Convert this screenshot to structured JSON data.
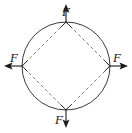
{
  "figure": {
    "name": "biaxial-tension-circle-diagram",
    "background_color": "#ffffff",
    "stroke_color": "#3a3a3a",
    "dashed_stroke_color": "#6e6e6e",
    "arrow_color": "#1a1a1a",
    "circle": {
      "center_x": 66,
      "center_y": 66,
      "radius": 44
    },
    "diamond": {
      "style": "dashed",
      "vertices": [
        {
          "name": "top",
          "x": 66,
          "y": 22
        },
        {
          "name": "right",
          "x": 110,
          "y": 66
        },
        {
          "name": "bottom",
          "x": 66,
          "y": 110
        },
        {
          "name": "left",
          "x": 22,
          "y": 66
        }
      ]
    },
    "forces": [
      {
        "name": "force-top",
        "label": "F",
        "direction": "up",
        "label_x": 66,
        "label_y": 16,
        "tail_x": 66,
        "tail_y": 22,
        "tip_x": 66,
        "tip_y": 5
      },
      {
        "name": "force-right",
        "label": "F",
        "direction": "right",
        "label_x": 118,
        "label_y": 62,
        "tail_x": 110,
        "tail_y": 66,
        "tip_x": 128,
        "tip_y": 66
      },
      {
        "name": "force-bottom",
        "label": "F",
        "direction": "down",
        "label_x": 60,
        "label_y": 124,
        "tail_x": 66,
        "tail_y": 110,
        "tip_x": 66,
        "tip_y": 128
      },
      {
        "name": "force-left",
        "label": "F",
        "direction": "left",
        "label_x": 12,
        "label_y": 62,
        "tail_x": 22,
        "tail_y": 66,
        "tip_x": 4,
        "tip_y": 66
      }
    ]
  }
}
